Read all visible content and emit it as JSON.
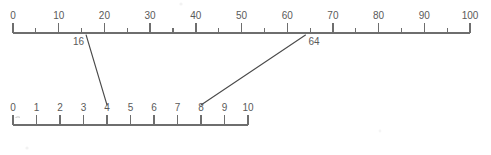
{
  "diagram": {
    "title": "",
    "colors": {
      "background": "#ffffff",
      "axis": "#6e6e6e",
      "tick": "#6e6e6e",
      "label": "#5a5a5a",
      "connector": "#4a4a4a"
    },
    "top_scale": {
      "name": "top-number-line",
      "min": 0,
      "max": 100,
      "major_step": 10,
      "minor_step": 5,
      "major_ticks": [
        0,
        10,
        20,
        30,
        40,
        50,
        60,
        70,
        80,
        90,
        100
      ],
      "minor_ticks": [
        5,
        15,
        25,
        35,
        45,
        55,
        65,
        75,
        85,
        95
      ],
      "labels": [
        "0",
        "10",
        "20",
        "30",
        "40",
        "50",
        "60",
        "70",
        "80",
        "90",
        "100"
      ],
      "marked_values": [
        {
          "value": 16,
          "label": "16",
          "label_side": "left"
        },
        {
          "value": 64,
          "label": "64",
          "label_side": "right"
        }
      ]
    },
    "bottom_scale": {
      "name": "bottom-number-line",
      "min": 0,
      "max": 10,
      "major_step": 1,
      "major_ticks": [
        0,
        1,
        2,
        3,
        4,
        5,
        6,
        7,
        8,
        9,
        10
      ],
      "labels": [
        "0",
        "1",
        "2",
        "3",
        "4",
        "5",
        "6",
        "7",
        "8",
        "9",
        "10"
      ],
      "marked_values": [
        {
          "value": 4,
          "label": "4"
        },
        {
          "value": 8,
          "label": "8"
        }
      ]
    },
    "connectors": [
      {
        "name": "connector-16-to-4",
        "from_value": 16,
        "to_value": 4,
        "from_label": "16",
        "to_label": "4"
      },
      {
        "name": "connector-64-to-8",
        "from_value": 64,
        "to_value": 8,
        "from_label": "64",
        "to_label": "8"
      }
    ]
  },
  "chart_data": {
    "type": "line",
    "title": "",
    "xlabel": "",
    "ylabel": "",
    "series": [
      {
        "name": "top-number-line",
        "axis_range": [
          0,
          100
        ],
        "major_tick_interval": 10,
        "minor_tick_interval": 5,
        "tick_labels": [
          "0",
          "10",
          "20",
          "30",
          "40",
          "50",
          "60",
          "70",
          "80",
          "90",
          "100"
        ],
        "annotated_points": [
          16,
          64
        ]
      },
      {
        "name": "bottom-number-line",
        "axis_range": [
          0,
          10
        ],
        "major_tick_interval": 1,
        "minor_tick_interval": 0,
        "tick_labels": [
          "0",
          "1",
          "2",
          "3",
          "4",
          "5",
          "6",
          "7",
          "8",
          "9",
          "10"
        ],
        "annotated_points": [
          4,
          8
        ]
      }
    ],
    "mappings": [
      {
        "top": 16,
        "bottom": 4
      },
      {
        "top": 64,
        "bottom": 8
      }
    ]
  }
}
